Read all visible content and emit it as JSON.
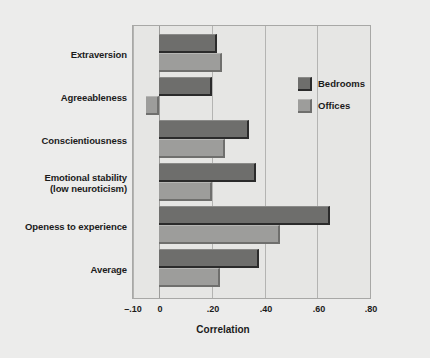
{
  "chart_data": {
    "type": "bar",
    "orientation": "horizontal",
    "title": "",
    "xlabel": "Correlation",
    "ylabel": "",
    "xlim": [
      -0.1,
      0.8
    ],
    "xticks": [
      -0.1,
      0,
      0.2,
      0.4,
      0.6,
      0.8
    ],
    "xtick_labels": [
      "–.10",
      "0",
      ".20",
      ".40",
      ".60",
      ".80"
    ],
    "grid": true,
    "grid_axis": "x",
    "legend_position": "upper right inside",
    "categories": [
      "Extraversion",
      "Agreeableness",
      "Conscientiousness",
      "Emotional stability\n(low neuroticism)",
      "Openess to experience",
      "Average"
    ],
    "category_lines": [
      [
        "Extraversion"
      ],
      [
        "Agreeableness"
      ],
      [
        "Conscientiousness"
      ],
      [
        "Emotional stability",
        "(low neuroticism)"
      ],
      [
        "Openess to experience"
      ],
      [
        "Average"
      ]
    ],
    "series": [
      {
        "name": "Bedrooms",
        "color": "#6e6e6c",
        "values": [
          0.22,
          0.2,
          0.34,
          0.37,
          0.65,
          0.38
        ]
      },
      {
        "name": "Offices",
        "color": "#9d9d9b",
        "values": [
          0.24,
          -0.05,
          0.25,
          0.2,
          0.46,
          0.23
        ]
      }
    ]
  },
  "legend": {
    "items": [
      {
        "label": "Bedrooms",
        "swatch": "bedrooms"
      },
      {
        "label": "Offices",
        "swatch": "offices"
      }
    ]
  },
  "axis": {
    "x_title": "Correlation"
  },
  "colors": {
    "background": "#e8e8e6",
    "plot_background": "#e6e6e4",
    "frame": "#a8a8a6",
    "gridline": "#b4b4b2",
    "bedrooms": "#6e6e6c",
    "offices": "#9d9d9b",
    "text": "#1b1b1b"
  }
}
